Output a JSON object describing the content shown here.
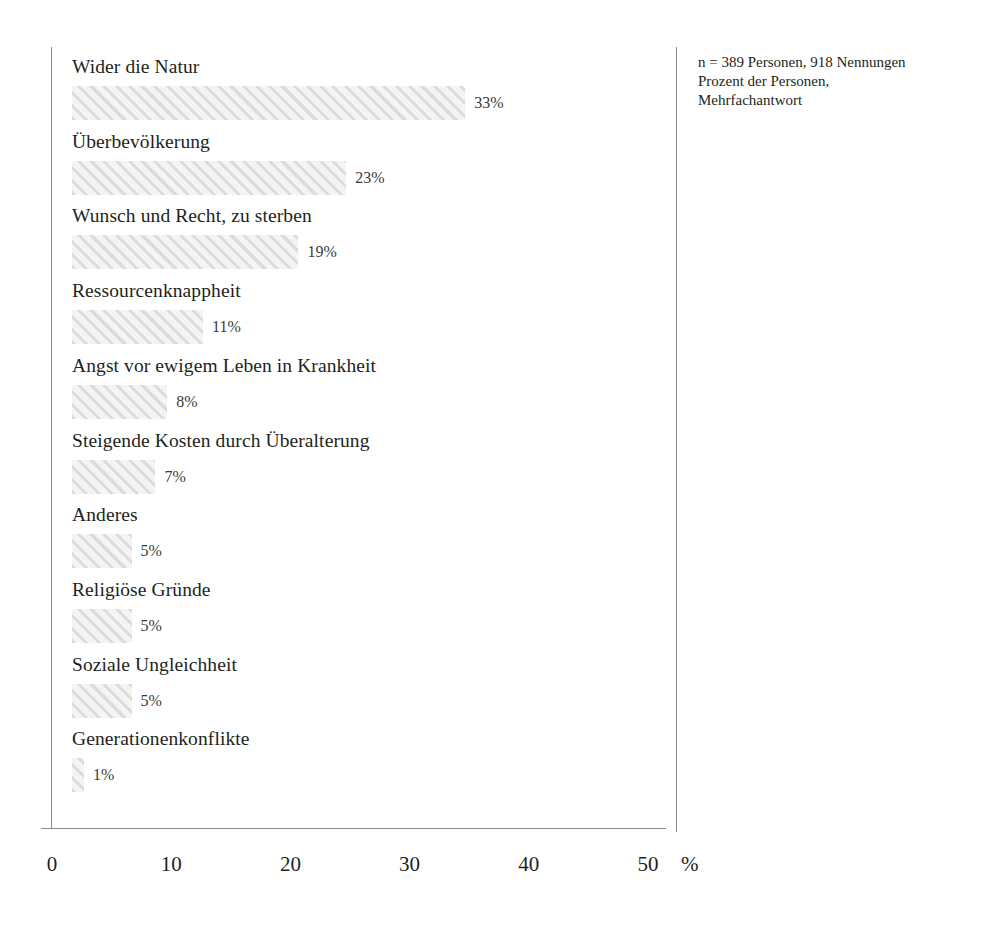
{
  "chart_data": {
    "type": "bar",
    "orientation": "horizontal",
    "title": "",
    "xlabel": "%",
    "ylabel": "",
    "xlim": [
      0,
      50
    ],
    "xticks": [
      "0",
      "10",
      "20",
      "30",
      "40",
      "50"
    ],
    "xtick_values": [
      0,
      10,
      20,
      30,
      40,
      50
    ],
    "grid": false,
    "legend": null,
    "categories": [
      "Wider die Natur",
      "Überbevölkerung",
      "Wunsch und Recht, zu sterben",
      "Ressourcenknappheit",
      "Angst vor ewigem Leben in Krankheit",
      "Steigende Kosten durch Überalterung",
      "Anderes",
      "Religiöse Gründe",
      "Soziale Ungleichheit",
      "Generationenkonflikte"
    ],
    "values": [
      33,
      23,
      19,
      11,
      8,
      7,
      5,
      5,
      5,
      1
    ],
    "value_labels": [
      "33%",
      "23%",
      "19%",
      "11%",
      "8%",
      "7%",
      "5%",
      "5%",
      "5%",
      "1%"
    ],
    "bar_fill": "#f4f4f4",
    "bar_hatch_color": "#dcdcdc",
    "axis_color": "#8c8c8c",
    "text_color": "#231f20"
  },
  "annotation": {
    "line1": "n = 389 Personen, 918 Nennungen",
    "line2": "Prozent der Personen,",
    "line3": "Mehrfachantwort"
  },
  "axis": {
    "unit": "%"
  }
}
